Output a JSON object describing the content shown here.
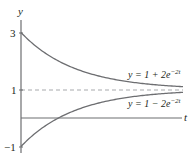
{
  "chart_data": {
    "type": "line",
    "title": "",
    "xlabel": "t",
    "ylabel": "y",
    "xlim": [
      0,
      1.5
    ],
    "ylim": [
      -1,
      3
    ],
    "y_ticks": [
      "3",
      "1",
      "−1"
    ],
    "y_tick_values": [
      3,
      1,
      -1
    ],
    "grid": false,
    "asymptote": {
      "y": 1,
      "style": "dashed"
    },
    "series": [
      {
        "name": "y = 1 + 2e^{−2t}",
        "formula": "1 + 2*exp(-2t)",
        "x": [
          0,
          0.1,
          0.2,
          0.3,
          0.4,
          0.5,
          0.6,
          0.8,
          1.0,
          1.2,
          1.5
        ],
        "values": [
          3.0,
          2.64,
          2.34,
          2.1,
          1.9,
          1.74,
          1.6,
          1.4,
          1.27,
          1.18,
          1.1
        ]
      },
      {
        "name": "y = 1 − 2e^{−2t}",
        "formula": "1 - 2*exp(-2t)",
        "x": [
          0,
          0.1,
          0.2,
          0.3,
          0.4,
          0.5,
          0.6,
          0.8,
          1.0,
          1.2,
          1.5
        ],
        "values": [
          -1.0,
          -0.64,
          -0.34,
          -0.1,
          0.1,
          0.26,
          0.4,
          0.6,
          0.73,
          0.82,
          0.9
        ]
      }
    ]
  },
  "labels": {
    "y_axis": "y",
    "t_axis": "t",
    "tick_3": "3",
    "tick_1": "1",
    "tick_neg1": "−1",
    "upper_prefix": "y = 1 + 2e",
    "upper_exp": "−2t",
    "lower_prefix": "y = 1 − 2e",
    "lower_exp": "−2t"
  },
  "colors": {
    "curve": "#6d6e71",
    "axis": "#6d6e71",
    "dashed": "#a7a9ac",
    "text": "#231f20"
  }
}
